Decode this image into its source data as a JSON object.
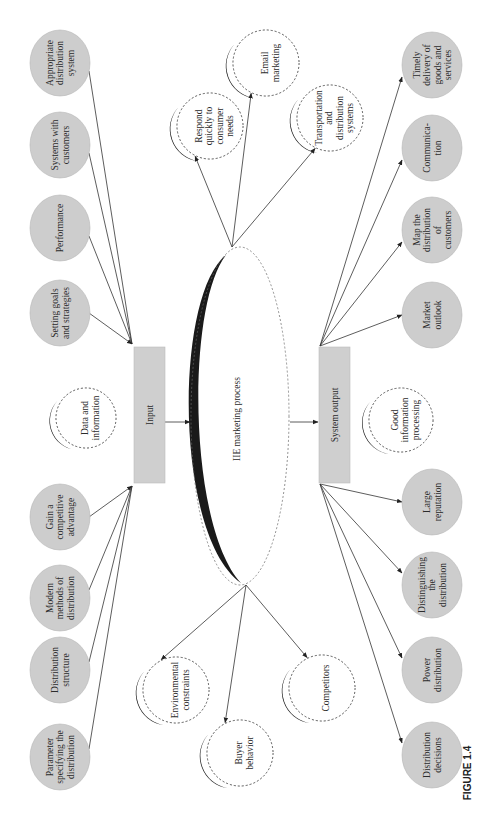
{
  "figure": {
    "caption": "FIGURE 1.4",
    "orientation": "rotated 90° counter-clockwise (text reads bottom-to-top)",
    "colors": {
      "box_fill": "#cfcfcf",
      "node_fill": "#cdcdcd",
      "crescent": "#1a1a1a",
      "line": "#333333"
    }
  },
  "center": {
    "label": "IIE marketing process",
    "outputs": [
      {
        "id": "respond",
        "label": [
          "Respond",
          "quickly to",
          "consumer",
          "needs"
        ]
      },
      {
        "id": "email",
        "label": [
          "Email",
          "marketing"
        ]
      },
      {
        "id": "transport",
        "label": [
          "Transportation",
          "and",
          "distribution",
          "systems"
        ]
      },
      {
        "id": "environment",
        "label": [
          "Environmental",
          "constraints"
        ]
      },
      {
        "id": "buyer",
        "label": [
          "Buyer",
          "behavior"
        ]
      },
      {
        "id": "competitors",
        "label": [
          "Competitors"
        ]
      }
    ]
  },
  "input": {
    "label": "Input",
    "side_note": [
      "Data and",
      "information"
    ],
    "sources_top": [
      {
        "id": "appropriate",
        "label": [
          "Appropriate",
          "distribution",
          "system"
        ]
      },
      {
        "id": "systems",
        "label": [
          "Systems with",
          "customers"
        ]
      },
      {
        "id": "performance",
        "label": [
          "Performance"
        ]
      },
      {
        "id": "goals",
        "label": [
          "Setting goals",
          "and strategies"
        ]
      }
    ],
    "sources_bottom": [
      {
        "id": "competitive",
        "label": [
          "Gain a",
          "competitive",
          "advantage"
        ]
      },
      {
        "id": "modern",
        "label": [
          "Modern",
          "methods of",
          "distribution"
        ]
      },
      {
        "id": "structure",
        "label": [
          "Distribution",
          "structure"
        ]
      },
      {
        "id": "parameter",
        "label": [
          "Parameter",
          "specifying the",
          "distribution"
        ]
      }
    ]
  },
  "output": {
    "label": "System output",
    "side_note": [
      "Good",
      "information",
      "processing"
    ],
    "targets_top": [
      {
        "id": "timely",
        "label": [
          "Timely",
          "delivery of",
          "goods and",
          "services"
        ]
      },
      {
        "id": "communication",
        "label": [
          "Communica-",
          "tion"
        ]
      },
      {
        "id": "map",
        "label": [
          "Map the",
          "distribution",
          "of",
          "customers"
        ]
      },
      {
        "id": "market",
        "label": [
          "Market",
          "outlook"
        ]
      }
    ],
    "targets_bottom": [
      {
        "id": "reputation",
        "label": [
          "Large",
          "reputation"
        ]
      },
      {
        "id": "distinguishing",
        "label": [
          "Distinguishing",
          "the",
          "distribution"
        ]
      },
      {
        "id": "power",
        "label": [
          "Power",
          "distribution"
        ]
      },
      {
        "id": "decisions",
        "label": [
          "Distribution",
          "decisions"
        ]
      }
    ]
  }
}
